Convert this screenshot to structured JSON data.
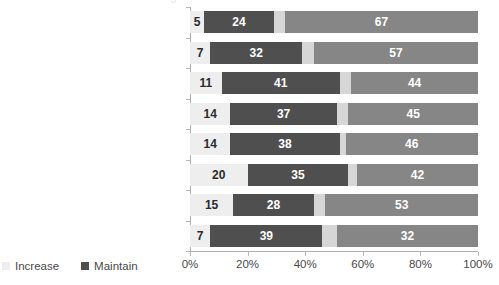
{
  "chart_data": {
    "type": "bar",
    "subtype": "stacked-bar-horizontal-100",
    "title": "",
    "xlabel": "",
    "ylabel": "",
    "xlim": [
      0,
      100
    ],
    "xticks": [
      "0%",
      "20%",
      "40%",
      "60%",
      "80%",
      "100%"
    ],
    "xtick_values": [
      0,
      20,
      40,
      60,
      80,
      100
    ],
    "grid": false,
    "legend_position": "bottom-left",
    "categories": [
      "Private trade shows",
      "Media events",
      "Hospitality events",
      "User conferences",
      "Dealer or distributor meetings",
      "VIP customer events",
      "Road shows",
      "Product launches"
    ],
    "series": [
      {
        "name": "Increase",
        "color": "#eeeeee",
        "in_legend": true,
        "values": [
          5,
          7,
          11,
          14,
          14,
          20,
          15,
          7
        ]
      },
      {
        "name": "Maintain",
        "color": "#4f4f4f",
        "in_legend": true,
        "values": [
          24,
          32,
          41,
          37,
          38,
          35,
          28,
          39
        ]
      },
      {
        "name": "",
        "color": "#d6d6d6",
        "in_legend": false,
        "values": [
          4,
          4,
          4,
          4,
          2,
          3,
          4,
          5
        ]
      },
      {
        "name": "",
        "color": "#868686",
        "in_legend": false,
        "values": [
          67,
          57,
          44,
          45,
          46,
          42,
          53,
          49
        ]
      }
    ],
    "bar_labels": [
      [
        "5",
        "24",
        "",
        "67"
      ],
      [
        "7",
        "32",
        "",
        "57"
      ],
      [
        "11",
        "41",
        "",
        "44"
      ],
      [
        "14",
        "37",
        "",
        "45"
      ],
      [
        "14",
        "38",
        "",
        "46"
      ],
      [
        "20",
        "35",
        "",
        "42"
      ],
      [
        "15",
        "28",
        "",
        "53"
      ],
      [
        "7",
        "39",
        "",
        "32"
      ]
    ]
  },
  "legend": {
    "items": [
      {
        "label": "Increase",
        "color": "#eeeeee"
      },
      {
        "label": "Maintain",
        "color": "#4f4f4f"
      }
    ]
  },
  "title_sliver": "g"
}
